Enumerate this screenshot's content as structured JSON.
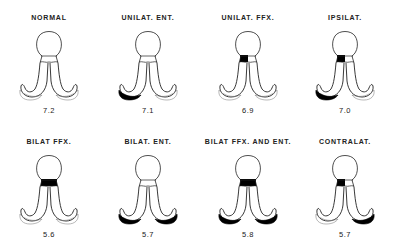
{
  "figure": {
    "panels": [
      {
        "label": "NORMAL",
        "value": "7.2",
        "shaded": {
          "top_left": false,
          "top_right": false,
          "foot_left": false,
          "foot_right": false
        }
      },
      {
        "label": "UNILAT. ENT.",
        "value": "7.1",
        "shaded": {
          "top_left": false,
          "top_right": false,
          "foot_left": true,
          "foot_right": false
        }
      },
      {
        "label": "UNILAT. FFX.",
        "value": "6.9",
        "shaded": {
          "top_left": true,
          "top_right": false,
          "foot_left": false,
          "foot_right": false
        }
      },
      {
        "label": "IPSILAT.",
        "value": "7.0",
        "shaded": {
          "top_left": true,
          "top_right": false,
          "foot_left": true,
          "foot_right": false
        }
      },
      {
        "label": "BILAT FFX.",
        "value": "5.6",
        "shaded": {
          "top_left": true,
          "top_right": true,
          "foot_left": false,
          "foot_right": false
        }
      },
      {
        "label": "BILAT. ENT.",
        "value": "5.7",
        "shaded": {
          "top_left": false,
          "top_right": false,
          "foot_left": true,
          "foot_right": true
        }
      },
      {
        "label": "BILAT FFX. AND ENT.",
        "value": "5.8",
        "shaded": {
          "top_left": true,
          "top_right": true,
          "foot_left": true,
          "foot_right": true
        }
      },
      {
        "label": "CONTRALAT.",
        "value": "5.7",
        "shaded": {
          "top_left": true,
          "top_right": false,
          "foot_left": false,
          "foot_right": true
        }
      }
    ],
    "colors": {
      "ink": "#111111",
      "fill": "#000000",
      "background": "#ffffff"
    }
  }
}
